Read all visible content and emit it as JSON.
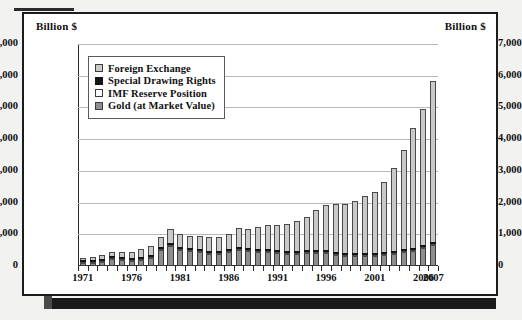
{
  "figure": {
    "unit_left": "Billion $",
    "unit_right": "Billion $"
  },
  "legend": {
    "items": [
      {
        "label": "Foreign Exchange",
        "key": "fx",
        "color": "#c9c9c9",
        "swatch": "sw-fx"
      },
      {
        "label": "Special Drawing Rights",
        "key": "sdr",
        "color": "#151515",
        "swatch": "sw-sdr"
      },
      {
        "label": "IMF Reserve Position",
        "key": "imf",
        "color": "#ffffff",
        "swatch": "sw-imf"
      },
      {
        "label": "Gold (at Market Value)",
        "key": "gold",
        "color": "#8e8e8e",
        "swatch": "sw-gold"
      }
    ]
  },
  "chart_data": {
    "type": "bar",
    "stacked": true,
    "title": "",
    "xlabel": "",
    "ylabel": "Billion $",
    "ylim": [
      0,
      7000
    ],
    "yticks": [
      0,
      1000,
      2000,
      3000,
      4000,
      5000,
      6000,
      7000
    ],
    "ytick_labels": [
      "0",
      "1,000",
      "2,000",
      "3,000",
      "4,000",
      "5,000",
      "6,000",
      "7,000"
    ],
    "grid": true,
    "legend_position": "upper-left-inside",
    "axis_dual": true,
    "xtick_labels": [
      "1971",
      "1976",
      "1981",
      "1986",
      "1991",
      "1996",
      "2001",
      "2006",
      "2007"
    ],
    "categories": [
      "1971",
      "1972",
      "1973",
      "1974",
      "1975",
      "1976",
      "1977",
      "1978",
      "1979",
      "1980",
      "1981",
      "1982",
      "1983",
      "1984",
      "1985",
      "1986",
      "1987",
      "1988",
      "1989",
      "1990",
      "1991",
      "1992",
      "1993",
      "1994",
      "1995",
      "1996",
      "1997",
      "1998",
      "1999",
      "2000",
      "2001",
      "2002",
      "2003",
      "2004",
      "2005",
      "2006",
      "2007"
    ],
    "series": [
      {
        "name": "Gold (at Market Value)",
        "key": "gold",
        "color": "#8e8e8e",
        "values": [
          48,
          67,
          110,
          175,
          160,
          120,
          165,
          230,
          470,
          600,
          480,
          430,
          420,
          360,
          360,
          400,
          480,
          430,
          420,
          400,
          380,
          350,
          360,
          370,
          375,
          370,
          330,
          300,
          300,
          280,
          280,
          320,
          360,
          400,
          440,
          540,
          620
        ]
      },
      {
        "name": "IMF Reserve Position",
        "key": "imf",
        "color": "#ffffff",
        "values": [
          6,
          7,
          7,
          9,
          13,
          18,
          19,
          15,
          14,
          20,
          26,
          29,
          41,
          42,
          41,
          38,
          38,
          35,
          29,
          27,
          31,
          34,
          38,
          40,
          50,
          52,
          60,
          60,
          55,
          47,
          57,
          66,
          66,
          55,
          28,
          17,
          16
        ]
      },
      {
        "name": "Special Drawing Rights",
        "key": "sdr",
        "color": "#151515",
        "values": [
          6,
          9,
          9,
          9,
          10,
          9,
          9,
          11,
          15,
          17,
          21,
          19,
          16,
          17,
          19,
          20,
          25,
          22,
          21,
          21,
          23,
          17,
          17,
          18,
          20,
          20,
          21,
          22,
          20,
          19,
          20,
          22,
          23,
          24,
          24,
          25,
          27
        ]
      },
      {
        "name": "Foreign Exchange",
        "key": "fx",
        "color": "#c9c9c9",
        "values": [
          75,
          100,
          110,
          130,
          145,
          185,
          250,
          275,
          310,
          430,
          410,
          390,
          400,
          420,
          420,
          480,
          590,
          620,
          700,
          780,
          790,
          840,
          930,
          1050,
          1250,
          1420,
          1500,
          1530,
          1640,
          1800,
          1920,
          2190,
          2600,
          3120,
          3780,
          4270,
          5100
        ]
      }
    ]
  }
}
